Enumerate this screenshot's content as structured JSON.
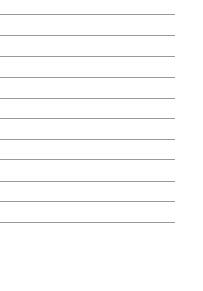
{
  "sheet": {
    "type": "lined-paper",
    "line_count": 11,
    "line_color": "#9a9a9a",
    "background_color": "#ffffff",
    "line_positions_y": [
      14,
      35,
      56,
      77,
      98,
      118,
      139,
      159,
      181,
      201,
      222
    ],
    "line_length_px": 175
  }
}
